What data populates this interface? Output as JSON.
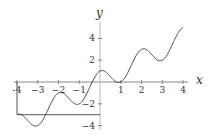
{
  "chart_data": {
    "type": "line",
    "title": "",
    "xlabel": "x",
    "ylabel": "y",
    "xlim": [
      -4,
      4
    ],
    "ylim": [
      -4,
      5
    ],
    "x_ticks": [
      "-4",
      "-3",
      "-2",
      "-1",
      "1",
      "2",
      "3",
      "4"
    ],
    "y_ticks": [
      "4",
      "2",
      "-2",
      "-4"
    ],
    "grid": false,
    "series": [
      {
        "name": "f(x)",
        "x": [
          -4,
          -3,
          -2,
          -1,
          0,
          1,
          2,
          3,
          4
        ],
        "values": [
          -3,
          -4,
          -1,
          -2,
          1,
          0,
          3,
          2,
          5
        ]
      }
    ],
    "annotations": [
      {
        "type": "segment",
        "from": [
          -4,
          0
        ],
        "to": [
          -4,
          -3
        ]
      },
      {
        "type": "segment",
        "from": [
          -4,
          -3
        ],
        "to": [
          0,
          -3
        ]
      }
    ]
  },
  "labels": {
    "x": "x",
    "y": "y"
  },
  "ticks": {
    "x": [
      {
        "v": -4,
        "t": "-4"
      },
      {
        "v": -3,
        "t": "−3"
      },
      {
        "v": -2,
        "t": "−2"
      },
      {
        "v": -1,
        "t": "−1"
      },
      {
        "v": 1,
        "t": "1"
      },
      {
        "v": 2,
        "t": "2"
      },
      {
        "v": 3,
        "t": "3"
      },
      {
        "v": 4,
        "t": "4"
      }
    ],
    "y": [
      {
        "v": 4,
        "t": "4"
      },
      {
        "v": 2,
        "t": "2"
      },
      {
        "v": -2,
        "t": "−2"
      },
      {
        "v": -4,
        "t": "−4"
      }
    ]
  }
}
